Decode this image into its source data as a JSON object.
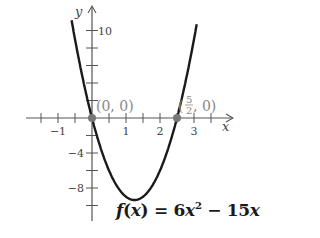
{
  "chart_data": {
    "type": "line",
    "title": "",
    "function": "f(x) = 6x^2 - 15x",
    "xlabel": "x",
    "ylabel": "y",
    "xlim": [
      -1.6,
      3.8
    ],
    "ylim": [
      -11,
      12
    ],
    "x_ticks_minor_step": 0.5,
    "y_ticks_minor_step": 2,
    "x_tick_labels": [
      {
        "value": -1,
        "label": "−1"
      },
      {
        "value": 1,
        "label": "1"
      },
      {
        "value": 2,
        "label": "2"
      },
      {
        "value": 3,
        "label": "3"
      }
    ],
    "y_tick_labels": [
      {
        "value": 10,
        "label": "10"
      },
      {
        "value": -4,
        "label": "−4"
      },
      {
        "value": -8,
        "label": "−8"
      }
    ],
    "grid": false,
    "series": [
      {
        "name": "f(x) = 6x^2 - 15x",
        "x": [
          -0.58,
          -0.5,
          0,
          0.5,
          1,
          1.25,
          1.5,
          2,
          2.5,
          3,
          3.08
        ],
        "y": [
          11.72,
          9,
          0,
          -6,
          -9,
          -9.375,
          -9,
          -6,
          0,
          9,
          10.72
        ],
        "color": "#1a1a1a"
      }
    ],
    "points": [
      {
        "x": 0,
        "y": 0,
        "label": "(0, 0)"
      },
      {
        "x": 2.5,
        "y": 0,
        "label": "(5/2, 0)"
      }
    ],
    "vertex": {
      "x": 1.25,
      "y": -9.375
    }
  },
  "labels": {
    "axis_x": "x",
    "axis_y": "y",
    "point_origin": "(0, 0)",
    "point_root_open": "(",
    "point_root_num": "5",
    "point_root_den": "2",
    "point_root_close": ", 0)",
    "formula_f": "f",
    "formula_open": "(",
    "formula_x": "x",
    "formula_eq": ") = 6",
    "formula_x2": "x",
    "formula_exp": "2",
    "formula_rest": " − 15",
    "formula_x3": "x"
  }
}
